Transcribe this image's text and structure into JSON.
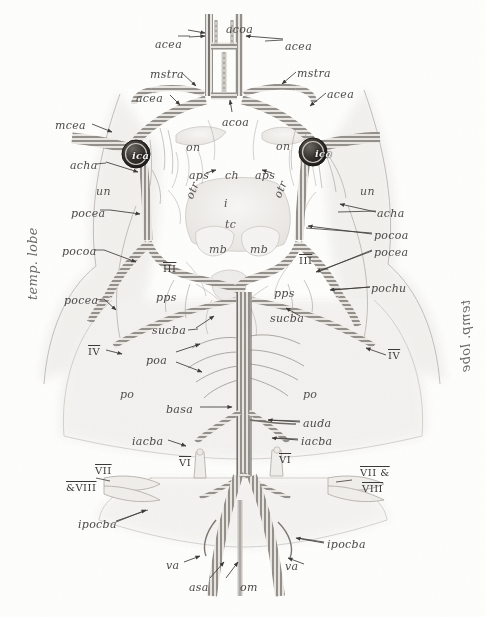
{
  "figure": {
    "type": "anatomical-illustration",
    "style": "pencil / stipple drawing with hatched vessel tubes",
    "colors": {
      "paper": "#fdfdfc",
      "ink": "#4c4a48",
      "vessel_stroke": "#55514c",
      "vessel_fill": "#e9e6e1",
      "tissue": "#efedea",
      "ica_node": "#2c2a28"
    }
  },
  "side_labels": [
    {
      "id": "temp-lobe-left",
      "text": "temp. lobe",
      "x": 26,
      "y": 300,
      "side": "left"
    },
    {
      "id": "temp-lobe-right",
      "text": "temp. lobe",
      "x": 459,
      "y": 300,
      "side": "right"
    }
  ],
  "labels": [
    {
      "id": "acoa-top",
      "text": "acoa",
      "x": 226,
      "y": 24,
      "kind": "vessel"
    },
    {
      "id": "acea-top-l",
      "text": "acea",
      "x": 155,
      "y": 39,
      "kind": "vessel"
    },
    {
      "id": "acea-top-r",
      "text": "acea",
      "x": 285,
      "y": 41,
      "kind": "vessel"
    },
    {
      "id": "mstra-l",
      "text": "mstra",
      "x": 150,
      "y": 69,
      "kind": "vessel"
    },
    {
      "id": "mstra-r",
      "text": "mstra",
      "x": 297,
      "y": 68,
      "kind": "vessel"
    },
    {
      "id": "acea-mid-l",
      "text": "acea",
      "x": 136,
      "y": 93,
      "kind": "vessel"
    },
    {
      "id": "acea-mid-r",
      "text": "acea",
      "x": 327,
      "y": 89,
      "kind": "vessel"
    },
    {
      "id": "acoa-mid",
      "text": "acoa",
      "x": 222,
      "y": 117,
      "kind": "vessel"
    },
    {
      "id": "mcea-l",
      "text": "mcea",
      "x": 55,
      "y": 120,
      "kind": "vessel"
    },
    {
      "id": "ica-l",
      "text": "ica",
      "x": 132,
      "y": 151,
      "kind": "node"
    },
    {
      "id": "ica-r",
      "text": "ica",
      "x": 315,
      "y": 149,
      "kind": "node"
    },
    {
      "id": "acha-l",
      "text": "acha",
      "x": 70,
      "y": 160,
      "kind": "vessel"
    },
    {
      "id": "on-l",
      "text": "on",
      "x": 186,
      "y": 142,
      "kind": "structure"
    },
    {
      "id": "on-r",
      "text": "on",
      "x": 276,
      "y": 141,
      "kind": "structure"
    },
    {
      "id": "aps-l",
      "text": "aps",
      "x": 189,
      "y": 170,
      "kind": "vessel"
    },
    {
      "id": "ch",
      "text": "ch",
      "x": 225,
      "y": 170,
      "kind": "structure"
    },
    {
      "id": "aps-r",
      "text": "aps",
      "x": 255,
      "y": 170,
      "kind": "vessel"
    },
    {
      "id": "otr-l",
      "text": "otr",
      "x": 184,
      "y": 185,
      "kind": "structure-rot"
    },
    {
      "id": "otr-r",
      "text": "otr",
      "x": 272,
      "y": 184,
      "kind": "structure-rot"
    },
    {
      "id": "un-l",
      "text": "un",
      "x": 96,
      "y": 186,
      "kind": "structure"
    },
    {
      "id": "un-r",
      "text": "un",
      "x": 360,
      "y": 186,
      "kind": "structure"
    },
    {
      "id": "i",
      "text": "i",
      "x": 224,
      "y": 198,
      "kind": "structure"
    },
    {
      "id": "pocea-l",
      "text": "pocea",
      "x": 71,
      "y": 208,
      "kind": "vessel"
    },
    {
      "id": "acha-r",
      "text": "acha",
      "x": 377,
      "y": 208,
      "kind": "vessel"
    },
    {
      "id": "tc",
      "text": "tc",
      "x": 225,
      "y": 219,
      "kind": "structure"
    },
    {
      "id": "pocoa-r",
      "text": "pocoa",
      "x": 374,
      "y": 230,
      "kind": "vessel"
    },
    {
      "id": "mb-l",
      "text": "mb",
      "x": 209,
      "y": 244,
      "kind": "structure"
    },
    {
      "id": "mb-r",
      "text": "mb",
      "x": 250,
      "y": 244,
      "kind": "structure"
    },
    {
      "id": "pocea-r",
      "text": "pocea",
      "x": 374,
      "y": 247,
      "kind": "vessel"
    },
    {
      "id": "pocoa-l",
      "text": "pocoa",
      "x": 62,
      "y": 246,
      "kind": "vessel"
    },
    {
      "id": "roman-iii-l",
      "text": "III",
      "x": 163,
      "y": 264,
      "kind": "nerve"
    },
    {
      "id": "roman-iii-r",
      "text": "III",
      "x": 299,
      "y": 256,
      "kind": "nerve"
    },
    {
      "id": "pochu-r",
      "text": "pochu",
      "x": 371,
      "y": 283,
      "kind": "vessel"
    },
    {
      "id": "pps-l",
      "text": "pps",
      "x": 156,
      "y": 292,
      "kind": "vessel"
    },
    {
      "id": "pps-r",
      "text": "pps",
      "x": 274,
      "y": 288,
      "kind": "vessel"
    },
    {
      "id": "pocea-l2",
      "text": "pocea",
      "x": 64,
      "y": 295,
      "kind": "vessel"
    },
    {
      "id": "sucba-r",
      "text": "sucba",
      "x": 270,
      "y": 313,
      "kind": "vessel"
    },
    {
      "id": "sucba-l",
      "text": "sucba",
      "x": 152,
      "y": 325,
      "kind": "vessel"
    },
    {
      "id": "roman-iv-l",
      "text": "IV",
      "x": 88,
      "y": 347,
      "kind": "nerve"
    },
    {
      "id": "roman-iv-r",
      "text": "IV",
      "x": 388,
      "y": 351,
      "kind": "nerve"
    },
    {
      "id": "poa",
      "text": "poa",
      "x": 146,
      "y": 355,
      "kind": "vessel"
    },
    {
      "id": "po-l",
      "text": "po",
      "x": 120,
      "y": 389,
      "kind": "structure"
    },
    {
      "id": "po-r",
      "text": "po",
      "x": 303,
      "y": 389,
      "kind": "structure"
    },
    {
      "id": "basa",
      "text": "basa",
      "x": 166,
      "y": 404,
      "kind": "vessel"
    },
    {
      "id": "auda",
      "text": "auda",
      "x": 303,
      "y": 418,
      "kind": "vessel"
    },
    {
      "id": "iacba-l",
      "text": "iacba",
      "x": 132,
      "y": 436,
      "kind": "vessel"
    },
    {
      "id": "iacba-r",
      "text": "iacba",
      "x": 301,
      "y": 436,
      "kind": "vessel"
    },
    {
      "id": "roman-vi-l",
      "text": "VI",
      "x": 179,
      "y": 458,
      "kind": "nerve"
    },
    {
      "id": "roman-vi-r",
      "text": "VI",
      "x": 279,
      "y": 455,
      "kind": "nerve"
    },
    {
      "id": "roman-vii-l",
      "text": "VII",
      "x": 95,
      "y": 466,
      "kind": "nerve"
    },
    {
      "id": "roman-viii-l",
      "text": "&amp;VIII",
      "x": 66,
      "y": 483,
      "kind": "nerve"
    },
    {
      "id": "roman-vii-r",
      "text": "VII &amp;",
      "x": 360,
      "y": 468,
      "kind": "nerve"
    },
    {
      "id": "roman-viii-r",
      "text": "VIII",
      "x": 362,
      "y": 484,
      "kind": "nerve"
    },
    {
      "id": "ipocba-l",
      "text": "ipocba",
      "x": 78,
      "y": 519,
      "kind": "vessel"
    },
    {
      "id": "ipocba-r",
      "text": "ipocba",
      "x": 327,
      "y": 539,
      "kind": "vessel"
    },
    {
      "id": "va-l",
      "text": "va",
      "x": 166,
      "y": 560,
      "kind": "vessel"
    },
    {
      "id": "va-r",
      "text": "va",
      "x": 285,
      "y": 561,
      "kind": "vessel"
    },
    {
      "id": "asa",
      "text": "asa",
      "x": 189,
      "y": 582,
      "kind": "vessel"
    },
    {
      "id": "om",
      "text": "om",
      "x": 240,
      "y": 582,
      "kind": "vessel"
    }
  ]
}
